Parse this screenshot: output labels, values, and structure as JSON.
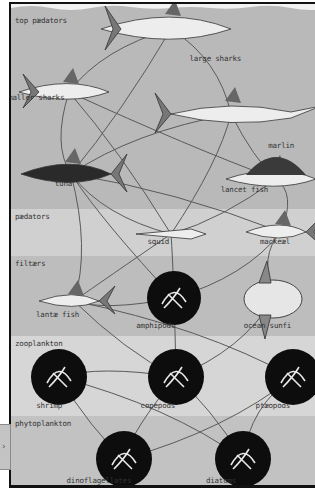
{
  "diagram": {
    "bands": [
      {
        "id": "top-predators",
        "label": "top pædators",
        "top": 0,
        "height": 205,
        "color": "#b9b9b9"
      },
      {
        "id": "predators",
        "label": "pædators",
        "top": 205,
        "height": 47,
        "color": "#d0d0d0"
      },
      {
        "id": "filterers",
        "label": "filtærs",
        "top": 252,
        "height": 80,
        "color": "#bdbdbd"
      },
      {
        "id": "zooplankton",
        "label": "zooplankton",
        "top": 332,
        "height": 80,
        "color": "#d6d6d6"
      },
      {
        "id": "phytoplankton",
        "label": "phytoplankton",
        "top": 412,
        "height": 80,
        "color": "#c2c2c2"
      }
    ],
    "organisms": [
      {
        "id": "large-sharks",
        "label": "large sharks",
        "band": "top-predators",
        "x": 215,
        "y": 62
      },
      {
        "id": "smaller-sharks",
        "label": "smaller sharks",
        "band": "top-predators",
        "x": 34,
        "y": 101
      },
      {
        "id": "marlin",
        "label": "marlin",
        "band": "top-predators",
        "x": 280,
        "y": 149
      },
      {
        "id": "tuna",
        "label": "tuna",
        "band": "top-predators",
        "x": 62,
        "y": 187
      },
      {
        "id": "lancet-fish",
        "label": "lancet fish",
        "band": "top-predators",
        "x": 244,
        "y": 193
      },
      {
        "id": "squid",
        "label": "squid",
        "band": "predators",
        "x": 157,
        "y": 245
      },
      {
        "id": "mackerel",
        "label": "mackeæl",
        "band": "predators",
        "x": 274,
        "y": 245
      },
      {
        "id": "lantern-fish",
        "label": "lantæ fish",
        "band": "filterers",
        "x": 57,
        "y": 318
      },
      {
        "id": "amphipods",
        "label": "amphipods",
        "band": "filterers",
        "x": 155,
        "y": 329
      },
      {
        "id": "ocean-sunfish",
        "label": "ocean sunfi",
        "band": "filterers",
        "x": 267,
        "y": 329
      },
      {
        "id": "shrimp",
        "label": "shrimp",
        "band": "zooplankton",
        "x": 48,
        "y": 409
      },
      {
        "id": "copepods",
        "label": "copepods",
        "band": "zooplankton",
        "x": 157,
        "y": 409
      },
      {
        "id": "pteropods",
        "label": "ptæopods",
        "band": "zooplankton",
        "x": 272,
        "y": 409
      },
      {
        "id": "dinoflagellates",
        "label": "dinoflagellates",
        "band": "phytoplankton",
        "x": 99,
        "y": 484
      },
      {
        "id": "diatoms",
        "label": "diatoms",
        "band": "phytoplankton",
        "x": 220,
        "y": 484
      }
    ],
    "links": [
      [
        "large-sharks",
        "smaller-sharks"
      ],
      [
        "large-sharks",
        "tuna"
      ],
      [
        "large-sharks",
        "marlin"
      ],
      [
        "smaller-sharks",
        "tuna"
      ],
      [
        "smaller-sharks",
        "squid"
      ],
      [
        "smaller-sharks",
        "lancet-fish"
      ],
      [
        "marlin",
        "tuna"
      ],
      [
        "marlin",
        "lancet-fish"
      ],
      [
        "marlin",
        "squid"
      ],
      [
        "tuna",
        "squid"
      ],
      [
        "tuna",
        "mackerel"
      ],
      [
        "tuna",
        "lantern-fish"
      ],
      [
        "tuna",
        "amphipods"
      ],
      [
        "lancet-fish",
        "squid"
      ],
      [
        "lancet-fish",
        "mackerel"
      ],
      [
        "squid",
        "lantern-fish"
      ],
      [
        "squid",
        "amphipods"
      ],
      [
        "mackerel",
        "amphipods"
      ],
      [
        "mackerel",
        "ocean-sunfish"
      ],
      [
        "lantern-fish",
        "copepods"
      ],
      [
        "lantern-fish",
        "pteropods"
      ],
      [
        "lantern-fish",
        "amphipods"
      ],
      [
        "amphipods",
        "copepods"
      ],
      [
        "ocean-sunfish",
        "copepods"
      ],
      [
        "shrimp",
        "copepods"
      ],
      [
        "shrimp",
        "dinoflagellates"
      ],
      [
        "shrimp",
        "diatoms"
      ],
      [
        "copepods",
        "dinoflagellates"
      ],
      [
        "copepods",
        "diatoms"
      ],
      [
        "pteropods",
        "dinoflagellates"
      ],
      [
        "pteropods",
        "diatoms"
      ]
    ],
    "colors": {
      "line": "#5a5a5a",
      "frame": "#111111",
      "plankton_disc": "#0d0d0d"
    },
    "side_tab": {
      "icon": "chevron-right-icon",
      "glyph": "›"
    }
  }
}
